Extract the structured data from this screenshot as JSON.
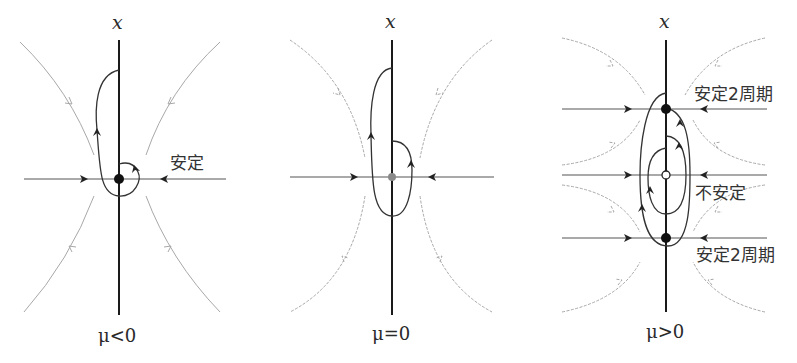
{
  "figure": {
    "panels": [
      {
        "id": "mu-negative",
        "axis_label": "x",
        "condition": "μ<0",
        "annotations": [
          "安定"
        ],
        "fixed_points": [
          {
            "type": "stable",
            "label": "安定"
          }
        ]
      },
      {
        "id": "mu-zero",
        "axis_label": "x",
        "condition": "μ=0",
        "annotations": [],
        "fixed_points": [
          {
            "type": "marginal"
          }
        ]
      },
      {
        "id": "mu-positive",
        "axis_label": "x",
        "condition": "μ>0",
        "annotations": [
          "安定2周期",
          "不安定",
          "安定2周期"
        ],
        "fixed_points": [
          {
            "type": "stable-2-cycle",
            "label": "安定2周期"
          },
          {
            "type": "unstable",
            "label": "不安定"
          },
          {
            "type": "stable-2-cycle",
            "label": "安定2周期"
          }
        ]
      }
    ],
    "colors": {
      "axis": "#1a1a1a",
      "trajectory": "#333333",
      "flow_lines": "#9a9a9a",
      "marginal_point": "#888888"
    }
  }
}
